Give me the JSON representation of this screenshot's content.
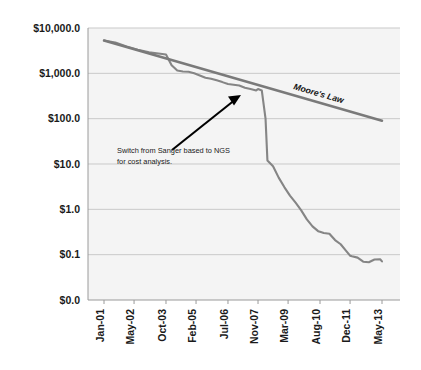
{
  "chart_data": {
    "type": "line",
    "title": "",
    "xlabel": "",
    "ylabel": "",
    "grid": true,
    "legend_position": "inline-annotation",
    "y_scale": "log",
    "y_tick_labels": [
      "$10,000.0",
      "$1,000.0",
      "$100.0",
      "$10.0",
      "$1.0",
      "$0.1",
      "$0.0"
    ],
    "y_tick_values": [
      10000,
      1000,
      100,
      10,
      1,
      0.1,
      0
    ],
    "ylim": [
      0.1,
      10000
    ],
    "x_tick_labels": [
      "Jan-01",
      "May-02",
      "Oct-03",
      "Feb-05",
      "Jul-06",
      "Nov-07",
      "Mar-09",
      "Aug-10",
      "Dec-11",
      "May-13"
    ],
    "series": [
      {
        "name": "Cost per Genome",
        "color": "#858585",
        "points": [
          {
            "x": "Jan-01",
            "y": 5300
          },
          {
            "x": "Jul-01",
            "y": 4800
          },
          {
            "x": "Jan-02",
            "y": 3900
          },
          {
            "x": "Jul-02",
            "y": 3300
          },
          {
            "x": "Jan-03",
            "y": 2900
          },
          {
            "x": "Jul-03",
            "y": 2700
          },
          {
            "x": "Oct-03",
            "y": 2600
          },
          {
            "x": "Jan-04",
            "y": 1500
          },
          {
            "x": "Apr-04",
            "y": 1150
          },
          {
            "x": "Jul-04",
            "y": 1100
          },
          {
            "x": "Oct-04",
            "y": 1080
          },
          {
            "x": "Jan-05",
            "y": 1000
          },
          {
            "x": "Apr-05",
            "y": 900
          },
          {
            "x": "Jul-05",
            "y": 800
          },
          {
            "x": "Oct-05",
            "y": 760
          },
          {
            "x": "Jan-06",
            "y": 700
          },
          {
            "x": "Apr-06",
            "y": 640
          },
          {
            "x": "Jul-06",
            "y": 580
          },
          {
            "x": "Oct-06",
            "y": 560
          },
          {
            "x": "Jan-07",
            "y": 540
          },
          {
            "x": "Apr-07",
            "y": 480
          },
          {
            "x": "Jul-07",
            "y": 450
          },
          {
            "x": "Oct-07",
            "y": 420
          },
          {
            "x": "Nov-07",
            "y": 450
          },
          {
            "x": "Jan-08",
            "y": 420
          },
          {
            "x": "Mar-08",
            "y": 100
          },
          {
            "x": "Apr-08",
            "y": 12
          },
          {
            "x": "Jul-08",
            "y": 8.9
          },
          {
            "x": "Oct-08",
            "y": 5.0
          },
          {
            "x": "Jan-09",
            "y": 3.1
          },
          {
            "x": "Apr-09",
            "y": 2.0
          },
          {
            "x": "Jul-09",
            "y": 1.4
          },
          {
            "x": "Oct-09",
            "y": 0.95
          },
          {
            "x": "Jan-10",
            "y": 0.6
          },
          {
            "x": "Apr-10",
            "y": 0.42
          },
          {
            "x": "Jul-10",
            "y": 0.33
          },
          {
            "x": "Aug-10",
            "y": 0.32
          },
          {
            "x": "Oct-10",
            "y": 0.3
          },
          {
            "x": "Jan-11",
            "y": 0.29
          },
          {
            "x": "Apr-11",
            "y": 0.21
          },
          {
            "x": "Jul-11",
            "y": 0.17
          },
          {
            "x": "Oct-11",
            "y": 0.12
          },
          {
            "x": "Dec-11",
            "y": 0.095
          },
          {
            "x": "Jan-12",
            "y": 0.092
          },
          {
            "x": "Apr-12",
            "y": 0.086
          },
          {
            "x": "Jul-12",
            "y": 0.07
          },
          {
            "x": "Oct-12",
            "y": 0.068
          },
          {
            "x": "Jan-13",
            "y": 0.078
          },
          {
            "x": "Apr-13",
            "y": 0.079
          },
          {
            "x": "May-13",
            "y": 0.071
          }
        ]
      },
      {
        "name": "Moore's Law",
        "color": "#7a7a7a",
        "points": [
          {
            "x": "Jan-01",
            "y": 5300
          },
          {
            "x": "May-13",
            "y": 90
          }
        ]
      }
    ],
    "annotations": [
      {
        "name": "ngs-switch-note",
        "text_line1": "Switch from Sanger based to NGS",
        "text_line2": "for cost analysis.",
        "arrow": true,
        "arrow_color": "#000000",
        "points_to": {
          "x": "Oct-07",
          "y": 430
        }
      },
      {
        "name": "moores-law-label",
        "text_line1": "Moore's Law",
        "text_line2": "",
        "arrow": false,
        "arrow_color": "#000000",
        "points_to": null
      }
    ]
  }
}
